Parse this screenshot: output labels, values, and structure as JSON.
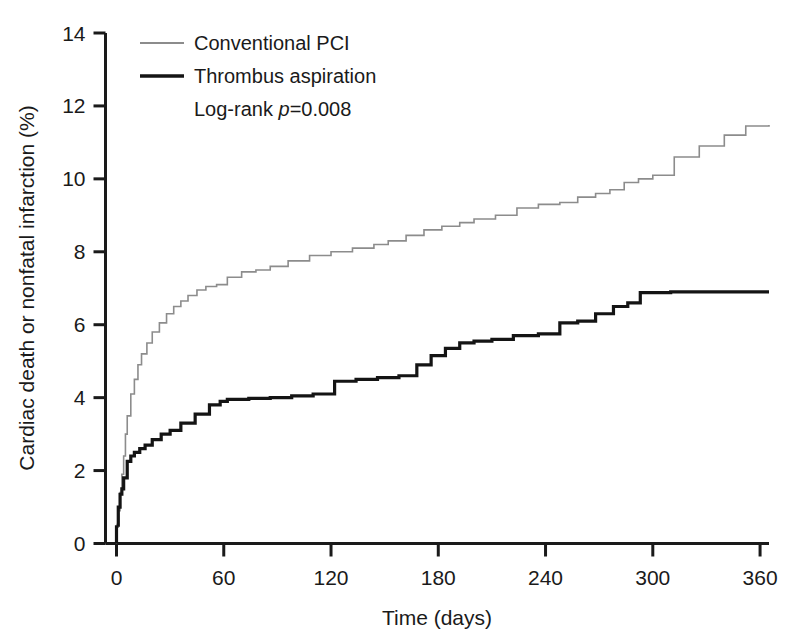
{
  "chart_data": {
    "type": "line",
    "title": "",
    "subtitle": "",
    "xlabel": "Time (days)",
    "ylabel": "Cardiac death or nonfatal infarction (%)",
    "xlim": [
      0,
      365
    ],
    "ylim": [
      0,
      14
    ],
    "xticks": [
      0,
      60,
      120,
      180,
      240,
      300,
      360
    ],
    "xtick_labels": [
      "0",
      "60",
      "120",
      "180",
      "240",
      "300",
      "360"
    ],
    "yticks": [
      0,
      2,
      4,
      6,
      8,
      10,
      12,
      14
    ],
    "ytick_labels": [
      "0",
      "2",
      "4",
      "6",
      "8",
      "10",
      "12",
      "14"
    ],
    "grid": false,
    "legend_position": "top-left",
    "step_type": "post",
    "annotations": [
      {
        "name": "log-rank-statistic",
        "text_prefix": "Log-rank ",
        "text_italic": "p",
        "text_suffix": "=0.008"
      }
    ],
    "series": [
      {
        "name": "Conventional PCI",
        "color": "#8c8c8c",
        "line_width": 1.6,
        "x": [
          0,
          1,
          2,
          3,
          4,
          5,
          6,
          8,
          10,
          12,
          14,
          17,
          20,
          24,
          28,
          32,
          36,
          40,
          45,
          50,
          56,
          62,
          70,
          78,
          86,
          96,
          108,
          120,
          132,
          144,
          152,
          162,
          172,
          182,
          192,
          200,
          212,
          224,
          236,
          248,
          258,
          268,
          276,
          284,
          292,
          300,
          312,
          326,
          340,
          352,
          365
        ],
        "y": [
          0.45,
          0.9,
          1.4,
          1.9,
          2.4,
          3.0,
          3.5,
          4.1,
          4.5,
          4.9,
          5.2,
          5.5,
          5.8,
          6.05,
          6.3,
          6.5,
          6.65,
          6.8,
          6.95,
          7.05,
          7.1,
          7.3,
          7.45,
          7.5,
          7.6,
          7.75,
          7.9,
          8.0,
          8.1,
          8.2,
          8.3,
          8.45,
          8.6,
          8.7,
          8.8,
          8.9,
          9.0,
          9.2,
          9.3,
          9.35,
          9.5,
          9.6,
          9.7,
          9.9,
          10.0,
          10.1,
          10.6,
          10.9,
          11.2,
          11.45,
          11.48
        ]
      },
      {
        "name": "Thrombus aspiration",
        "color": "#141414",
        "line_width": 3.2,
        "x": [
          0,
          1,
          2,
          3,
          4,
          6,
          8,
          10,
          13,
          16,
          20,
          25,
          30,
          36,
          44,
          52,
          58,
          62,
          74,
          86,
          98,
          110,
          122,
          134,
          146,
          158,
          168,
          176,
          184,
          192,
          200,
          210,
          222,
          236,
          248,
          258,
          268,
          278,
          286,
          293,
          310,
          330,
          350,
          365
        ],
        "y": [
          0.5,
          1.0,
          1.35,
          1.5,
          1.8,
          2.25,
          2.4,
          2.5,
          2.6,
          2.7,
          2.85,
          3.0,
          3.1,
          3.3,
          3.55,
          3.8,
          3.9,
          3.95,
          3.98,
          4.0,
          4.05,
          4.1,
          4.45,
          4.5,
          4.55,
          4.6,
          4.9,
          5.15,
          5.35,
          5.5,
          5.55,
          5.6,
          5.7,
          5.75,
          6.05,
          6.1,
          6.3,
          6.5,
          6.6,
          6.88,
          6.9,
          6.9,
          6.9,
          6.9
        ]
      }
    ]
  },
  "legend": {
    "items": [
      {
        "label": "Conventional PCI",
        "swatch_name": "legend-swatch-conventional-pci"
      },
      {
        "label": "Thrombus aspiration",
        "swatch_name": "legend-swatch-thrombus-aspiration"
      }
    ]
  },
  "axes": {
    "x_axis_title": "Time (days)",
    "y_axis_title": "Cardiac death or nonfatal infarction (%)"
  },
  "colors": {
    "conventional_pci": "#8c8c8c",
    "thrombus_aspiration": "#141414",
    "axis": "#1a1a1a",
    "background": "#ffffff"
  }
}
